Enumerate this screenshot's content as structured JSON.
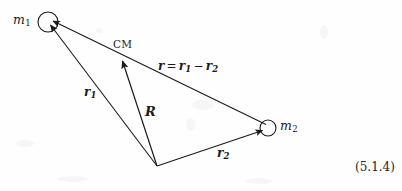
{
  "figure": {
    "kind": "physics-vector-diagram",
    "background_color": "#fefefe",
    "ink_color": "#1a1a1a",
    "equation_number": "(5.1.4)",
    "bodies": [
      {
        "id": "m1",
        "label": "m",
        "subscript": "1",
        "cx": 48,
        "cy": 22,
        "r": 10,
        "label_x": 13,
        "label_y": 14
      },
      {
        "id": "m2",
        "label": "m",
        "subscript": "2",
        "cx": 268,
        "cy": 128,
        "r": 8,
        "label_x": 280,
        "label_y": 120
      }
    ],
    "center_of_mass": {
      "label": "CM",
      "x": 122,
      "y": 58,
      "label_x": 113,
      "label_y": 39
    },
    "origin": {
      "x": 157,
      "y": 166
    },
    "vectors": [
      {
        "id": "r1",
        "label": "r",
        "subscript": "1",
        "from": "origin",
        "to": "m1",
        "label_x": 84,
        "label_y": 86
      },
      {
        "id": "r2",
        "label": "r",
        "subscript": "2",
        "from": "origin",
        "to": "m2",
        "label_x": 217,
        "label_y": 147
      },
      {
        "id": "R",
        "label": "R",
        "subscript": "",
        "from": "origin",
        "to": "CM",
        "label_x": 145,
        "label_y": 105
      },
      {
        "id": "r",
        "label": "r",
        "subscript": "",
        "from": "m2",
        "to": "m1",
        "label_x": 158,
        "label_y": 60,
        "expression": {
          "lhs": "r",
          "equals": "=",
          "term1": "r",
          "term1_sub": "1",
          "minus": "−",
          "term2": "r",
          "term2_sub": "2"
        }
      }
    ],
    "eq_number_x": 355,
    "eq_number_y": 161
  }
}
